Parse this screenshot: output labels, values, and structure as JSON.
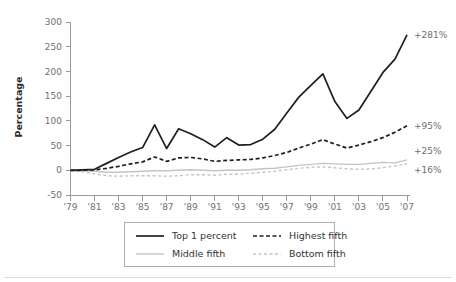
{
  "chart_data": {
    "type": "line",
    "title": "",
    "xlabel": "",
    "ylabel": "Percentage",
    "xlim": [
      1979,
      2007
    ],
    "ylim": [
      -50,
      300
    ],
    "grid": false,
    "legend_position": "bottom",
    "x": [
      1979,
      1980,
      1981,
      1982,
      1983,
      1984,
      1985,
      1986,
      1987,
      1988,
      1989,
      1990,
      1991,
      1992,
      1993,
      1994,
      1995,
      1996,
      1997,
      1998,
      1999,
      2000,
      2001,
      2002,
      2003,
      2004,
      2005,
      2006,
      2007
    ],
    "x_tick_labels": [
      "'79",
      "'81",
      "'83",
      "'85",
      "'87",
      "'89",
      "'91",
      "'93",
      "'95",
      "'97",
      "'99",
      "'01",
      "'03",
      "'05",
      "'07"
    ],
    "x_tick_values": [
      1979,
      1981,
      1983,
      1985,
      1987,
      1989,
      1991,
      1993,
      1995,
      1997,
      1999,
      2001,
      2003,
      2005,
      2007
    ],
    "y_tick_labels": [
      "300",
      "250",
      "200",
      "150",
      "100",
      "50",
      "0",
      "-50"
    ],
    "y_tick_values": [
      300,
      250,
      200,
      150,
      100,
      50,
      0,
      -50
    ],
    "series": [
      {
        "name": "Top 1 percent",
        "style": "solid",
        "color": "#1f1f1f",
        "width": 1.7,
        "end_label": "+281%",
        "values": [
          0,
          1,
          2,
          14,
          26,
          37,
          46,
          92,
          44,
          84,
          74,
          62,
          47,
          66,
          51,
          52,
          63,
          83,
          116,
          148,
          172,
          195,
          139,
          105,
          122,
          160,
          198,
          225,
          274
        ]
      },
      {
        "name": "Highest fifth",
        "style": "dashed",
        "color": "#1f1f1f",
        "width": 1.7,
        "end_label": "+95%",
        "values": [
          0,
          0,
          1,
          4,
          8,
          13,
          17,
          27,
          18,
          25,
          26,
          23,
          18,
          20,
          21,
          22,
          25,
          30,
          36,
          45,
          53,
          62,
          53,
          45,
          51,
          58,
          66,
          77,
          90
        ]
      },
      {
        "name": "Middle fifth",
        "style": "solid",
        "color": "#c4c4c4",
        "width": 1.4,
        "end_label": "+25%",
        "values": [
          0,
          -1,
          -2,
          -4,
          -4,
          -3,
          -2,
          -1,
          -1,
          0,
          1,
          0,
          -1,
          0,
          0,
          1,
          3,
          4,
          7,
          10,
          12,
          14,
          13,
          12,
          12,
          14,
          16,
          15,
          21
        ]
      },
      {
        "name": "Bottom fifth",
        "style": "dashed",
        "color": "#c4c4c4",
        "width": 1.4,
        "end_label": "+16%",
        "values": [
          0,
          -3,
          -7,
          -11,
          -12,
          -11,
          -11,
          -11,
          -12,
          -11,
          -9,
          -9,
          -10,
          -8,
          -8,
          -6,
          -4,
          -2,
          1,
          4,
          6,
          7,
          5,
          3,
          2,
          3,
          5,
          9,
          13
        ]
      }
    ]
  },
  "legend": {
    "items": [
      {
        "label": "Top 1 percent"
      },
      {
        "label": "Highest fifth"
      },
      {
        "label": "Middle fifth"
      },
      {
        "label": "Bottom fifth"
      }
    ]
  },
  "annotations": [
    {
      "text": "+281%"
    },
    {
      "text": "+95%"
    },
    {
      "text": "+25%"
    },
    {
      "text": "+16%"
    }
  ],
  "colors": {
    "dark_series": "#1f1f1f",
    "light_series": "#c4c4c4",
    "axis": "#9a9a9a",
    "tick_text": "#6f6f6f",
    "background": "#ffffff"
  }
}
